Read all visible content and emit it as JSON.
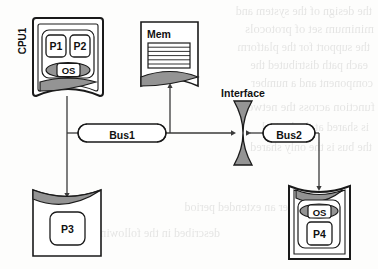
{
  "diagram": {
    "nodes": {
      "cpu1": {
        "label": "CPU1",
        "processes": [
          "P1",
          "P2"
        ],
        "os_label": "OS"
      },
      "mem": {
        "label": "Mem"
      },
      "p3": {
        "label": "P3"
      },
      "p4": {
        "label": "P4",
        "os_label": "OS"
      },
      "interface": {
        "label": "Interface"
      },
      "bus1": {
        "label": "Bus1"
      },
      "bus2": {
        "label": "Bus2"
      }
    },
    "colors": {
      "stroke": "#1a1a1a",
      "fill_white": "#ffffff",
      "fill_gray": "#949494",
      "fill_light": "#f2f2f2",
      "page": "#fdfdfc"
    }
  },
  "bleedthrough": {
    "lines": [
      "the design of the system and",
      "minimum set of protocols",
      "the support for the platform",
      "each path distributed the",
      "component and a number",
      "function across the network",
      "is shared at the logical",
      "the bus is the only shared",
      "over an extended period",
      "described in the following"
    ]
  }
}
